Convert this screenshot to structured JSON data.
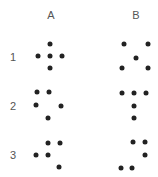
{
  "columns": [
    {
      "label": "A",
      "x": 51,
      "y": 15
    },
    {
      "label": "B",
      "x": 136,
      "y": 15
    }
  ],
  "rows": [
    {
      "label": "1",
      "x": 13,
      "y": 57,
      "A": {
        "pattern": "plus",
        "dots": [
          [
            50,
            44
          ],
          [
            38,
            56
          ],
          [
            50,
            56
          ],
          [
            62,
            56
          ],
          [
            50,
            68
          ]
        ]
      },
      "B": {
        "pattern": "x",
        "dots": [
          [
            124,
            44
          ],
          [
            148,
            44
          ],
          [
            136,
            58
          ],
          [
            122,
            68
          ],
          [
            148,
            68
          ]
        ]
      }
    },
    {
      "label": "2",
      "x": 13,
      "y": 106,
      "A": {
        "pattern": "scattered",
        "dots": [
          [
            37,
            92
          ],
          [
            49,
            92
          ],
          [
            36,
            105
          ],
          [
            61,
            106
          ],
          [
            48,
            118
          ]
        ]
      },
      "B": {
        "pattern": "T-shape",
        "dots": [
          [
            122,
            93
          ],
          [
            134,
            93
          ],
          [
            146,
            93
          ],
          [
            134,
            106
          ],
          [
            134,
            118
          ]
        ]
      }
    },
    {
      "label": "3",
      "x": 13,
      "y": 155,
      "A": {
        "pattern": "stair",
        "dots": [
          [
            48,
            143
          ],
          [
            60,
            143
          ],
          [
            36,
            155
          ],
          [
            48,
            155
          ],
          [
            59,
            167
          ]
        ]
      },
      "B": {
        "pattern": "hook",
        "dots": [
          [
            133,
            142
          ],
          [
            145,
            142
          ],
          [
            145,
            155
          ],
          [
            121,
            168
          ],
          [
            132,
            168
          ]
        ]
      }
    }
  ],
  "colors": {
    "dot": "#222222",
    "label": "#555555",
    "background": "#ffffff"
  }
}
